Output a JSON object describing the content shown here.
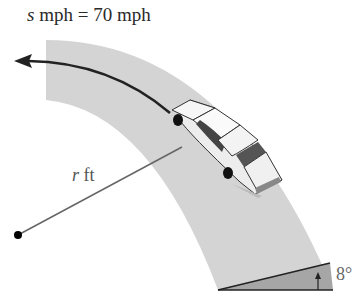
{
  "diagram": {
    "speed_label": {
      "var": "s",
      "text": " mph = 70 mph"
    },
    "radius_label": {
      "var": "r",
      "text": " ft"
    },
    "bank_angle_label": "8°",
    "colors": {
      "road": "#d2d2d2",
      "bank": "#a8a8a8",
      "arrow": "#222222",
      "radius_line": "#666666"
    }
  }
}
